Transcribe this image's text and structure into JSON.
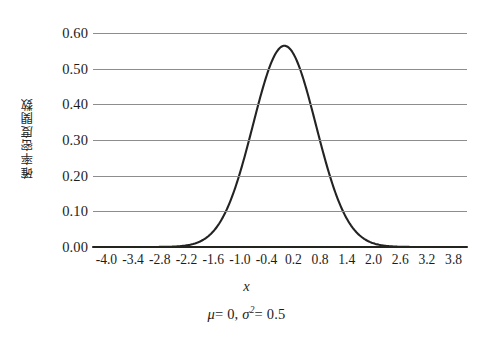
{
  "chart_data": {
    "type": "line",
    "title": "",
    "subtitle": "",
    "caption": "μ = 0, σ² = 0.5",
    "caption_parts": {
      "mu_symbol": "μ",
      "mu_value": "= 0,",
      "sigma_symbol": "σ",
      "sigma_exponent": "2",
      "sigma_value": "= 0.5"
    },
    "xlabel": "x",
    "ylabel": "確率密度関数",
    "xlim": [
      -4.3,
      4.1
    ],
    "ylim": [
      0.0,
      0.6
    ],
    "grid": true,
    "grid_axis": "y",
    "legend": false,
    "legend_position": "none",
    "series_name": "normal probability density function",
    "distribution": {
      "mean": 0,
      "variance": 0.5,
      "peak_value": 0.5642
    },
    "x_tick_labels": [
      "-4.0",
      "-3.4",
      "-2.8",
      "-2.2",
      "-1.6",
      "-1.0",
      "-0.4",
      "0.2",
      "0.8",
      "1.4",
      "2.0",
      "2.6",
      "3.2",
      "3.8"
    ],
    "x_tick_values": [
      -4.0,
      -3.4,
      -2.8,
      -2.2,
      -1.6,
      -1.0,
      -0.4,
      0.2,
      0.8,
      1.4,
      2.0,
      2.6,
      3.2,
      3.8
    ],
    "y_tick_labels": [
      "0.60",
      "0.50",
      "0.40",
      "0.30",
      "0.20",
      "0.10",
      "0.00"
    ],
    "y_tick_values": [
      0.6,
      0.5,
      0.4,
      0.3,
      0.2,
      0.1,
      0.0
    ],
    "x": [
      -4.0,
      -3.8,
      -3.6,
      -3.4,
      -3.2,
      -3.0,
      -2.8,
      -2.6,
      -2.4,
      -2.2,
      -2.0,
      -1.8,
      -1.6,
      -1.4,
      -1.2,
      -1.0,
      -0.8,
      -0.6,
      -0.4,
      -0.2,
      0.0,
      0.2,
      0.4,
      0.6,
      0.8,
      1.0,
      1.2,
      1.4,
      1.6,
      1.8,
      2.0,
      2.2,
      2.4,
      2.6,
      2.8,
      3.0,
      3.2,
      3.4,
      3.6,
      3.8,
      4.0
    ],
    "values": [
      0.0,
      0.0,
      0.0,
      0.0,
      0.0,
      0.0001,
      0.0002,
      0.0007,
      0.0022,
      0.0059,
      0.0146,
      0.0219,
      0.0447,
      0.0799,
      0.1295,
      0.1916,
      0.2636,
      0.3332,
      0.4101,
      0.482,
      0.5642,
      0.482,
      0.4101,
      0.3332,
      0.2636,
      0.1916,
      0.1295,
      0.0799,
      0.0447,
      0.0219,
      0.0146,
      0.0059,
      0.0022,
      0.0007,
      0.0002,
      0.0001,
      0.0,
      0.0,
      0.0,
      0.0,
      0.0
    ],
    "colors": {
      "curve": "#232323",
      "gridline": "#8d8d8d",
      "axis": "#24241f",
      "background": "#ffffff",
      "text": "#1c1c1c"
    }
  }
}
